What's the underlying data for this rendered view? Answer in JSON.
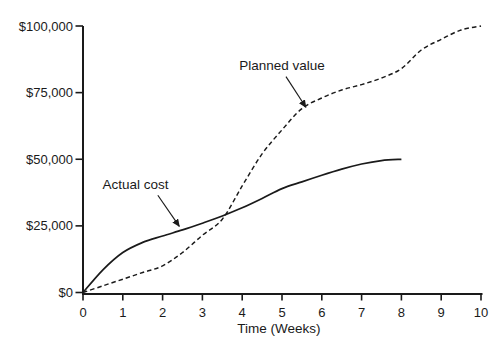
{
  "figure": {
    "background": "#ffffff",
    "line_color": "#1a1a1a",
    "text_color": "#1a1a1a"
  },
  "chart_data": {
    "type": "line",
    "title": "",
    "xlabel": "Time (Weeks)",
    "ylabel": "",
    "xlim": [
      0,
      10
    ],
    "ylim": [
      0,
      100000
    ],
    "grid": false,
    "legend_position": "none (inline text annotations with arrows)",
    "x_ticks": [
      {
        "value": 0,
        "label": "0"
      },
      {
        "value": 1,
        "label": "1"
      },
      {
        "value": 2,
        "label": "2"
      },
      {
        "value": 3,
        "label": "3"
      },
      {
        "value": 4,
        "label": "4"
      },
      {
        "value": 5,
        "label": "5"
      },
      {
        "value": 6,
        "label": "6"
      },
      {
        "value": 7,
        "label": "7"
      },
      {
        "value": 8,
        "label": "8"
      },
      {
        "value": 9,
        "label": "9"
      },
      {
        "value": 10,
        "label": "10"
      }
    ],
    "y_ticks": [
      {
        "value": 0,
        "label": "$0"
      },
      {
        "value": 25000,
        "label": "$25,000"
      },
      {
        "value": 50000,
        "label": "$50,000"
      },
      {
        "value": 75000,
        "label": "$75,000"
      },
      {
        "value": 100000,
        "label": "$100,000"
      }
    ],
    "series": [
      {
        "name": "Planned value",
        "line_style": "dashed",
        "color": "#1a1a1a",
        "x": [
          0,
          0.5,
          1,
          1.5,
          2,
          2.5,
          3,
          3.5,
          4,
          4.5,
          5,
          5.5,
          6,
          6.5,
          7,
          7.5,
          8,
          8.5,
          9,
          9.5,
          10
        ],
        "y": [
          0,
          2500,
          5000,
          7500,
          10000,
          15000,
          21500,
          27500,
          40000,
          52000,
          61000,
          69000,
          73000,
          76000,
          78000,
          80500,
          84000,
          91000,
          95000,
          98500,
          100000
        ]
      },
      {
        "name": "Actual cost",
        "line_style": "solid",
        "color": "#1a1a1a",
        "x": [
          0,
          0.5,
          1,
          1.5,
          2,
          2.5,
          3,
          3.5,
          4,
          4.5,
          5,
          5.5,
          6,
          6.5,
          7,
          7.5,
          8
        ],
        "y": [
          0,
          8500,
          15000,
          18800,
          21200,
          23500,
          26000,
          28700,
          31800,
          35300,
          39000,
          41500,
          44000,
          46300,
          48200,
          49500,
          50000
        ]
      }
    ],
    "annotations": [
      {
        "text": "Planned value",
        "label_x": 5.0,
        "label_y": 85000,
        "arrow_from_x": 5.1,
        "arrow_from_y": 81000,
        "arrow_to_x": 5.6,
        "arrow_to_y": 69500
      },
      {
        "text": "Actual cost",
        "label_x": 1.32,
        "label_y": 40600,
        "arrow_from_x": 1.88,
        "arrow_from_y": 36500,
        "arrow_to_x": 2.42,
        "arrow_to_y": 24800
      }
    ]
  }
}
